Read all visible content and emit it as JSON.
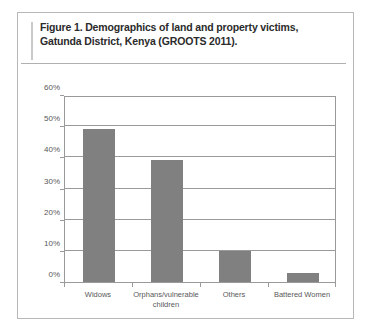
{
  "figure": {
    "title": "Figure 1. Demographics of land and property victims, Gatunda District, Kenya (GROOTS 2011).",
    "frame_border_color": "#b8b8b8",
    "rule_color": "#b0b0b0",
    "accent_rule_color": "#c9c9c9"
  },
  "chart_data": {
    "type": "bar",
    "title": "Figure 1. Demographics of land and property victims, Gatunda District, Kenya (GROOTS 2011).",
    "xlabel": "",
    "ylabel": "",
    "categories": [
      "Widows",
      "Orphans/vulnerable children",
      "Others",
      "Battered Women"
    ],
    "category_lines": [
      [
        "Widows"
      ],
      [
        "Orphans/vulnerable",
        "children"
      ],
      [
        "Others"
      ],
      [
        "Battered Women"
      ]
    ],
    "values": [
      49,
      39,
      10,
      3
    ],
    "value_labels": [
      "49%",
      "39%",
      "10%",
      "3%"
    ],
    "ylim": [
      0,
      60
    ],
    "ytick_values": [
      0,
      10,
      20,
      30,
      40,
      50,
      60
    ],
    "ytick_labels": [
      "0%",
      "10%",
      "20%",
      "30%",
      "40%",
      "50%",
      "60%"
    ],
    "grid": true,
    "grid_axis": "y",
    "legend": false,
    "legend_position": "none",
    "bar_color": "#808080",
    "axis_color": "#9a9a9a",
    "tick_label_color": "#58585a",
    "plot_background": "#ffffff"
  }
}
